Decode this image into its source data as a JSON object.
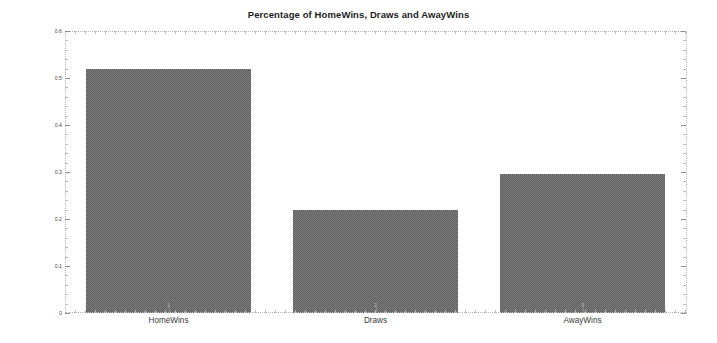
{
  "chart_data": {
    "type": "bar",
    "title": "Percentage of HomeWins, Draws and AwayWins",
    "xlabel": "",
    "ylabel": "Percentage",
    "categories": [
      "HomeWins",
      "Draws",
      "AwayWins"
    ],
    "values": [
      0.519,
      0.219,
      0.296
    ],
    "ylim": [
      0,
      0.6
    ],
    "ytick_labels": [
      "0",
      "0.1",
      "0.2",
      "0.3",
      "0.4",
      "0.5",
      "0.6"
    ],
    "ytick_values": [
      0,
      0.1,
      0.2,
      0.3,
      0.4,
      0.5,
      0.6
    ],
    "xtick_labels": [
      "1",
      "2",
      "3"
    ],
    "grid": false,
    "legend": "none",
    "bar_color": "#7d7d7d",
    "bar_edge_color": "#6f6f6f",
    "frame_color": "#b9b9b9",
    "background": "#ffffff"
  }
}
